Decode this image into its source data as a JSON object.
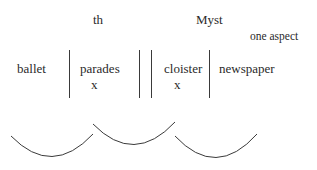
{
  "top_labels": {
    "left": "th",
    "right": "Myst",
    "annotation": "one aspect"
  },
  "words": {
    "w1": "ballet",
    "w2": "parades",
    "w3": "cloister",
    "w4": "newspaper"
  },
  "marks": {
    "under_w2": "x",
    "under_w3": "x"
  },
  "dividers": {
    "count": 4,
    "color": "#3a3a3a"
  },
  "arcs": {
    "count": 3,
    "color": "#3a3a3a"
  }
}
